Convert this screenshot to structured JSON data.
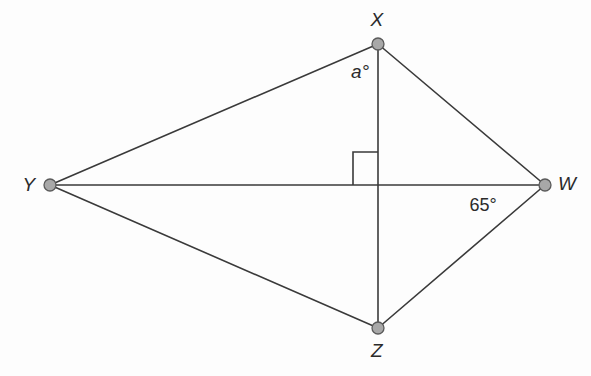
{
  "figure": {
    "name": "kite-wxyz-diagram",
    "background_color": "#fdfdfd",
    "stroke_color": "#3a3a3a",
    "vertex_fill_color": "#a8a8a8",
    "vertex_stroke_color": "#5a5a5a",
    "text_color": "#2b2b2b",
    "width": 591,
    "height": 376
  },
  "vertices": [
    {
      "id": "X",
      "label": "X",
      "x": 378,
      "y": 44,
      "label_x": 377,
      "label_y": 20,
      "dot_r": 6
    },
    {
      "id": "Y",
      "label": "Y",
      "x": 50,
      "y": 185,
      "label_x": 29,
      "label_y": 185,
      "dot_r": 6
    },
    {
      "id": "W",
      "label": "W",
      "x": 545,
      "y": 185,
      "label_x": 567,
      "label_y": 184,
      "dot_r": 6
    },
    {
      "id": "Z",
      "label": "Z",
      "x": 378,
      "y": 328,
      "label_x": 377,
      "label_y": 351,
      "dot_r": 6
    }
  ],
  "edges": [
    {
      "id": "YX",
      "from": "Y",
      "to": "X"
    },
    {
      "id": "XW",
      "from": "X",
      "to": "W"
    },
    {
      "id": "WZ",
      "from": "W",
      "to": "Z"
    },
    {
      "id": "ZY",
      "from": "Z",
      "to": "Y"
    }
  ],
  "diagonals": [
    {
      "id": "XZ",
      "from": "X",
      "to": "Z",
      "orientation": "vertical"
    },
    {
      "id": "YW",
      "from": "Y",
      "to": "W",
      "orientation": "horizontal"
    }
  ],
  "intersection": {
    "x": 378,
    "y": 185
  },
  "right_angle_marker": {
    "name": "right-angle-square",
    "quadrant": "upper-left",
    "x": 353,
    "y": 152,
    "size_w": 25,
    "size_h": 33
  },
  "angle_labels": [
    {
      "id": "angle-a",
      "text": "a°",
      "x": 360,
      "y": 72,
      "style": "italic",
      "at_vertex": "X"
    },
    {
      "id": "angle-65",
      "text": "65°",
      "x": 483,
      "y": 205,
      "style": "upright",
      "at_vertex": "W"
    }
  ]
}
